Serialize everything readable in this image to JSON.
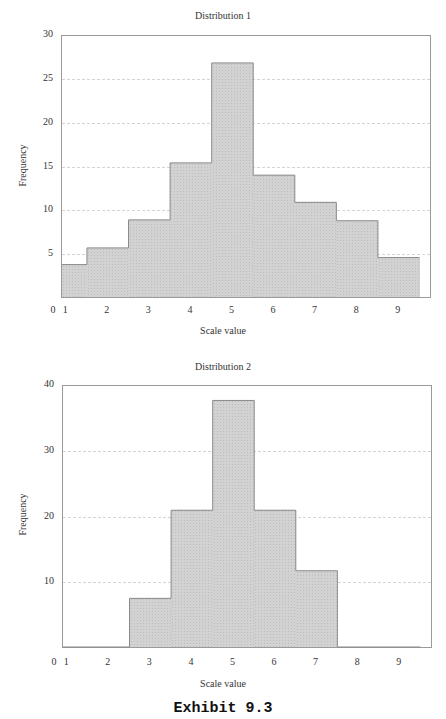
{
  "chart_data": [
    {
      "type": "bar",
      "title": "Distribution 1",
      "xlabel": "Scale value",
      "ylabel": "Frequency",
      "categories": [
        "1",
        "2",
        "3",
        "4",
        "5",
        "6",
        "7",
        "8",
        "9"
      ],
      "values": [
        3.7,
        5.6,
        8.8,
        15.3,
        26.7,
        13.9,
        10.8,
        8.7,
        4.5
      ],
      "x_ticks": [
        "0",
        "1",
        "2",
        "3",
        "4",
        "5",
        "6",
        "7",
        "8",
        "9"
      ],
      "y_ticks": [
        "5",
        "10",
        "15",
        "20",
        "25",
        "30"
      ],
      "ylim": [
        0,
        30
      ],
      "grid": true,
      "histogram": true
    },
    {
      "type": "bar",
      "title": "Distribution 2",
      "xlabel": "Scale value",
      "ylabel": "Frequency",
      "categories": [
        "1",
        "2",
        "3",
        "4",
        "5",
        "6",
        "7",
        "8",
        "9"
      ],
      "values": [
        0,
        0,
        7.4,
        20.8,
        37.5,
        20.8,
        11.6,
        0,
        0
      ],
      "x_ticks": [
        "0",
        "1",
        "2",
        "3",
        "4",
        "5",
        "6",
        "7",
        "8",
        "9"
      ],
      "y_ticks": [
        "10",
        "20",
        "30",
        "40"
      ],
      "ylim": [
        0,
        40
      ],
      "grid": true,
      "histogram": true
    }
  ],
  "caption": "Exhibit 9.3",
  "colors": {
    "bar_fill": "#d2d2d2",
    "bar_outline": "#8a8a8a",
    "grid": "#d4d4d4"
  }
}
